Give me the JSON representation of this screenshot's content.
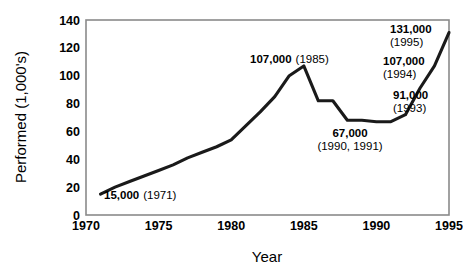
{
  "chart_data": {
    "type": "line",
    "title": "",
    "xlabel": "Year",
    "ylabel": "Performed (1,000's)",
    "xlim": [
      1970,
      1995
    ],
    "ylim": [
      0,
      140
    ],
    "xticks": [
      "1970",
      "1975",
      "1980",
      "1985",
      "1990",
      "1995"
    ],
    "yticks": [
      "0",
      "20",
      "40",
      "60",
      "80",
      "100",
      "120",
      "140"
    ],
    "grid": false,
    "legend": "none",
    "series": [
      {
        "name": "Procedures performed",
        "x": [
          1971,
          1972,
          1973,
          1974,
          1975,
          1976,
          1977,
          1978,
          1979,
          1980,
          1981,
          1982,
          1983,
          1984,
          1985,
          1986,
          1987,
          1988,
          1989,
          1990,
          1991,
          1992,
          1993,
          1994,
          1995
        ],
        "values": [
          15,
          20,
          24,
          28,
          32,
          36,
          41,
          45,
          49,
          54,
          64,
          74,
          85,
          100,
          107,
          82,
          82,
          68,
          68,
          67,
          67,
          72,
          91,
          107,
          131
        ]
      }
    ],
    "annotations": [
      {
        "id": "annot-1971",
        "value": "15,000",
        "year": "(1971)",
        "layout": "inline"
      },
      {
        "id": "annot-1985",
        "value": "107,000",
        "year": "(1985)",
        "layout": "inline"
      },
      {
        "id": "annot-1990-1991",
        "value": "67,000",
        "year": "(1990, 1991)",
        "layout": "stacked"
      },
      {
        "id": "annot-1993",
        "value": "91,000",
        "year": "(1993)",
        "layout": "stacked"
      },
      {
        "id": "annot-1994",
        "value": "107,000",
        "year": "(1994)",
        "layout": "stacked"
      },
      {
        "id": "annot-1995",
        "value": "131,000",
        "year": "(1995)",
        "layout": "stacked"
      }
    ],
    "style": {
      "line_color": "#1a1a1a",
      "frame_color": "#808080",
      "background": "#ffffff"
    }
  }
}
